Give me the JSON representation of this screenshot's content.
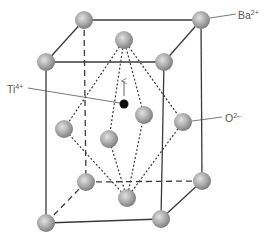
{
  "diagram": {
    "labels": {
      "ba": {
        "base": "Ba",
        "charge": "2+"
      },
      "ti": {
        "base": "Ti",
        "charge": "4+"
      },
      "o": {
        "base": "O",
        "charge": "2–"
      }
    },
    "colors": {
      "edge": "#3a3a3a",
      "sphere_light": "#dcdcdc",
      "sphere_mid": "#a8a8a8",
      "sphere_dark": "#7a7a7a",
      "ti": "#111111",
      "leader": "#555555"
    },
    "ba_ions": [
      {
        "id": "front-top-left",
        "x": 46,
        "y": 62
      },
      {
        "id": "front-top-right",
        "x": 164,
        "y": 62
      },
      {
        "id": "front-bottom-left",
        "x": 46,
        "y": 223
      },
      {
        "id": "front-bottom-right",
        "x": 161,
        "y": 219
      },
      {
        "id": "back-top-left",
        "x": 84,
        "y": 20
      },
      {
        "id": "back-top-right",
        "x": 201,
        "y": 20
      },
      {
        "id": "back-bottom-left",
        "x": 86,
        "y": 182
      },
      {
        "id": "back-bottom-right",
        "x": 202,
        "y": 181
      }
    ],
    "o_ions": [
      {
        "id": "top",
        "x": 124,
        "y": 40
      },
      {
        "id": "bottom",
        "x": 127,
        "y": 198
      },
      {
        "id": "left",
        "x": 64,
        "y": 129
      },
      {
        "id": "right",
        "x": 183,
        "y": 122
      },
      {
        "id": "front",
        "x": 109,
        "y": 139
      },
      {
        "id": "back",
        "x": 144,
        "y": 115
      }
    ],
    "ti_ion": {
      "x": 124,
      "y": 104
    },
    "displacement_arrow": {
      "direction": "up"
    }
  }
}
